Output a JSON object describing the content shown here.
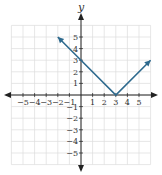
{
  "chart_data": {
    "type": "line",
    "title": "",
    "function": "y = |x - 3|",
    "xlabel": "",
    "ylabel": "y",
    "xlim": [
      -6,
      6
    ],
    "ylim": [
      -6,
      6
    ],
    "grid": true,
    "x_ticks": [
      -5,
      -4,
      -3,
      -2,
      -1,
      1,
      2,
      3,
      4,
      5
    ],
    "y_ticks": [
      5,
      4,
      3,
      2,
      1,
      -1,
      -2,
      -3,
      -4,
      -5
    ],
    "series": [
      {
        "name": "absolute value graph",
        "color": "#2e6a8e",
        "points": [
          [
            -2,
            5
          ],
          [
            0,
            3
          ],
          [
            3,
            0
          ],
          [
            6,
            3
          ]
        ],
        "arrows": "both ends"
      }
    ],
    "key_points": {
      "vertex": [
        3,
        0
      ],
      "y_intercept": [
        0,
        3
      ]
    }
  },
  "colors": {
    "line": "#2e6a8e",
    "axis": "#222222",
    "grid": "#dddddd"
  }
}
